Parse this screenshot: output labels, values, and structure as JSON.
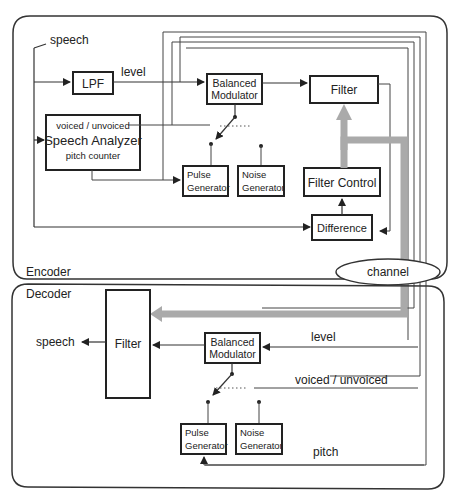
{
  "encoder": {
    "label": "Encoder",
    "input_label": "speech",
    "lpf": "LPF",
    "level_label": "level",
    "balanced_modulator": [
      "Balanced",
      "Modulator"
    ],
    "filter": "Filter",
    "speech_analyzer": {
      "top": "voiced / unvoiced",
      "title": "Speech Analyzer",
      "bottom": "pitch counter"
    },
    "pulse_generator": [
      "Pulse",
      "Generator"
    ],
    "noise_generator": [
      "Noise",
      "Generator"
    ],
    "filter_control": "Filter Control",
    "difference": "Difference"
  },
  "channel": "channel",
  "decoder": {
    "label": "Decoder",
    "output_label": "speech",
    "filter": "Filter",
    "balanced_modulator": [
      "Balanced",
      "Modulator"
    ],
    "level_label": "level",
    "voiced_label": "voiced / unvoiced",
    "pulse_generator": [
      "Pulse",
      "Generator"
    ],
    "noise_generator": [
      "Noise",
      "Generator"
    ],
    "pitch_label": "pitch"
  },
  "colors": {
    "line": "#333333",
    "channel_path": "#aaaaaa"
  }
}
